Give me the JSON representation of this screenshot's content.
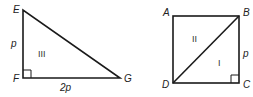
{
  "figure_left": {
    "shape": "right-triangle",
    "vertices": {
      "E": {
        "label": "E"
      },
      "F": {
        "label": "F"
      },
      "G": {
        "label": "G"
      }
    },
    "side_labels": {
      "EF": "p",
      "FG": "2p"
    },
    "region_label": "III",
    "right_angle_at": "F"
  },
  "figure_right": {
    "shape": "square-with-diagonal",
    "vertices": {
      "A": {
        "label": "A"
      },
      "B": {
        "label": "B"
      },
      "C": {
        "label": "C"
      },
      "D": {
        "label": "D"
      }
    },
    "side_labels": {
      "BC": "p"
    },
    "region_labels": {
      "upper": "II",
      "lower": "I"
    },
    "diagonal": "BD",
    "right_angle_at": "C"
  }
}
